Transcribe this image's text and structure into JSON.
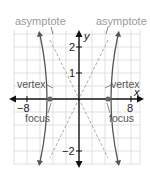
{
  "diagram": {
    "type": "hyperbola-graph",
    "labels": {
      "asymptote_left": "asymptote",
      "asymptote_right": "asymptote",
      "vertex_left": "vertex",
      "vertex_right": "vertex",
      "focus_left": "focus",
      "focus_right": "focus",
      "x_axis": "x",
      "y_axis": "y"
    },
    "ticks": {
      "x_neg": "−8",
      "x_pos": "8",
      "y_2": "2",
      "y_1": "1",
      "y_neg2": "−2"
    },
    "colors": {
      "axis": "#111111",
      "curve": "#555555",
      "asymptote": "#aaaaaa",
      "grid": "#d9d9d9",
      "label_gray": "#9a9a9a",
      "label_dark": "#333333",
      "focus_dot": "#666666"
    },
    "geometry": {
      "a": 4,
      "b": 2.06,
      "c": 4.5,
      "x_range": [
        -10,
        10
      ],
      "y_range": [
        -2.5,
        2.6
      ]
    }
  }
}
